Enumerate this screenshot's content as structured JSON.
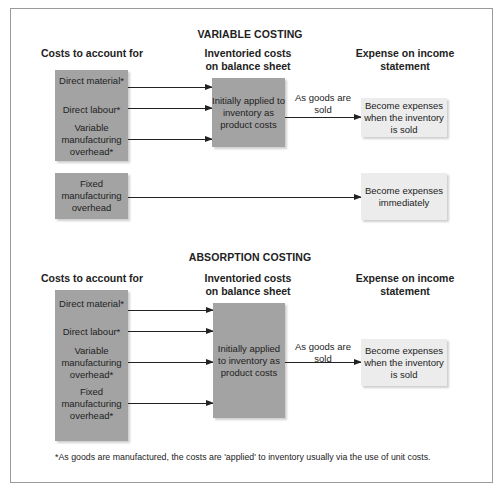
{
  "variable_costing": {
    "title": "VARIABLE COSTING",
    "headers": {
      "costs": "Costs to account for",
      "inventoried": "Inventoried costs on balance sheet",
      "expense": "Expense on income statement"
    },
    "variable_costs": [
      "Direct material*",
      "Direct labour*",
      "Variable manufacturing overhead*"
    ],
    "fixed_cost": "Fixed manufacturing overhead",
    "inventory_box": "Initially applied to inventory as product costs",
    "arrow_label": "As goods are sold",
    "expense_box_sold": "Become expenses when the inventory is sold",
    "expense_box_immediate": "Become expenses immediately"
  },
  "absorption_costing": {
    "title": "ABSORPTION COSTING",
    "headers": {
      "costs": "Costs to account for",
      "inventoried": "Inventoried costs on balance sheet",
      "expense": "Expense on income statement"
    },
    "costs": [
      "Direct material*",
      "Direct labour*",
      "Variable manufacturing overhead*",
      "Fixed manufacturing overhead*"
    ],
    "inventory_box": "Initially applied to inventory as product costs",
    "arrow_label": "As goods are sold",
    "expense_box": "Become expenses when the inventory is sold"
  },
  "footnote": "*As goods are manufactured, the costs are 'applied' to inventory usually via the use of unit costs.",
  "colors": {
    "dark_box": "#a3a3a3",
    "light_box": "#ececec",
    "border": "#9a9a9a"
  }
}
